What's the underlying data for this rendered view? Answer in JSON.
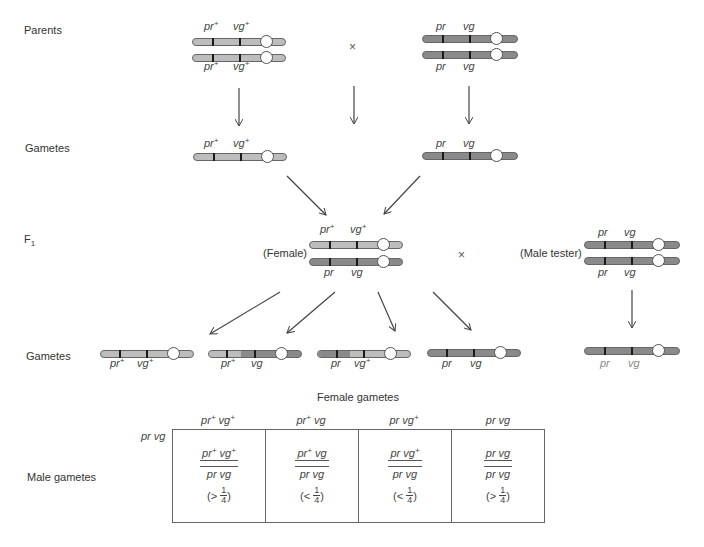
{
  "labels": {
    "parents": "Parents",
    "gametes_1": "Gametes",
    "f1": "F",
    "f1_sub": "1",
    "gametes_2": "Gametes",
    "female": "(Female)",
    "male_tester": "(Male tester)",
    "female_gametes": "Female gametes",
    "male_gametes": "Male gametes",
    "cross_symbol": "×",
    "male_gamete_row": "pr vg"
  },
  "genes": {
    "pr_plus": {
      "base": "pr",
      "sup": "+"
    },
    "vg_plus": {
      "base": "vg",
      "sup": "+"
    },
    "pr": {
      "base": "pr",
      "sup": ""
    },
    "vg": {
      "base": "vg",
      "sup": ""
    }
  },
  "colors": {
    "wildtype_chromosome": "#bdbdbd",
    "mutant_chromosome": "#8a8a8a",
    "gene_band": "#1a1a1a",
    "centromere": "#ffffff"
  },
  "punnett": {
    "columns": [
      {
        "header": "pr+ vg+",
        "top": "pr+ vg+",
        "bottom": "pr vg",
        "ratio_sign": "(>",
        "ratio_num": "1",
        "ratio_den": "4",
        "close": ")"
      },
      {
        "header": "pr+ vg",
        "top": "pr+ vg",
        "bottom": "pr vg",
        "ratio_sign": "(<",
        "ratio_num": "1",
        "ratio_den": "4",
        "close": ")"
      },
      {
        "header": "pr vg+",
        "top": "pr vg+",
        "bottom": "pr vg",
        "ratio_sign": "(<",
        "ratio_num": "1",
        "ratio_den": "4",
        "close": ")"
      },
      {
        "header": "pr vg",
        "top": "pr vg",
        "bottom": "pr vg",
        "ratio_sign": "(>",
        "ratio_num": "1",
        "ratio_den": "4",
        "close": ")"
      }
    ]
  }
}
